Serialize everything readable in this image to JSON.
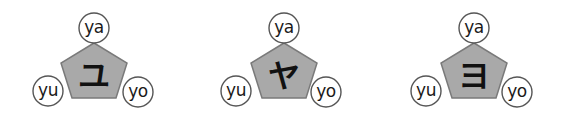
{
  "diagrams": [
    {
      "kana": "ユ",
      "labels": {
        "top": "ya",
        "left": "yu",
        "right": "yo"
      },
      "center_x": 94
    },
    {
      "kana": "ヤ",
      "labels": {
        "top": "ya",
        "left": "yu",
        "right": "yo"
      },
      "center_x": 284
    },
    {
      "kana": "ヨ",
      "labels": {
        "top": "ya",
        "left": "yu",
        "right": "yo"
      },
      "center_x": 474
    }
  ],
  "colors": {
    "pentagon_fill": "#a9a9a9",
    "pentagon_stroke": "#7a7a7a",
    "bubble_stroke": "#555555",
    "text": "#1a1a1a"
  }
}
